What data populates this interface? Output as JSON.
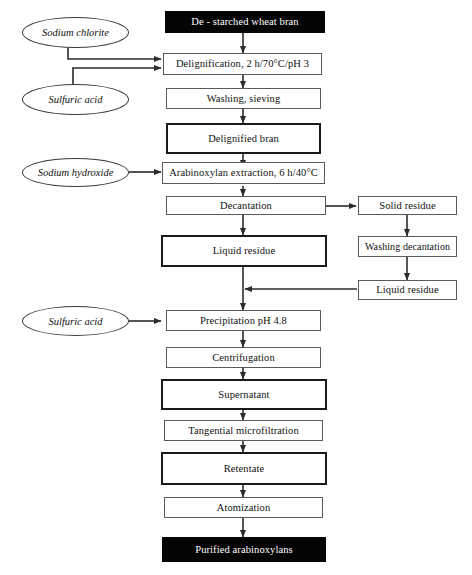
{
  "diagram": {
    "colors": {
      "terminal_fill": "#050505",
      "terminal_text": "#ffffff",
      "box_fill": "#ffffff",
      "box_border_thin": "#5a5a5a",
      "box_border_thick": "#1a1a1a",
      "arrow": "#2b2b2b",
      "background": "#ffffff"
    },
    "reagents": [
      {
        "id": "sodium-chlorite",
        "label": "Sodium chlorite",
        "shape": "ellipse"
      },
      {
        "id": "sulfuric-acid-1",
        "label": "Sulfuric acid",
        "shape": "ellipse"
      },
      {
        "id": "sodium-hydroxide",
        "label": "Sodium hydroxide",
        "shape": "ellipse"
      },
      {
        "id": "sulfuric-acid-2",
        "label": "Sulfuric acid",
        "shape": "ellipse"
      }
    ],
    "main_steps": [
      {
        "id": "de-starched-wheat-bran",
        "label": "De - starched wheat bran",
        "style": "terminal"
      },
      {
        "id": "delignification",
        "label": "Delignification, 2 h/70°C/pH 3",
        "style": "thin"
      },
      {
        "id": "washing-sieving",
        "label": "Washing, sieving",
        "style": "thin"
      },
      {
        "id": "delignified-bran",
        "label": "Delignified bran",
        "style": "thick"
      },
      {
        "id": "arabinoxylan-extraction",
        "label": "Arabinoxylan extraction, 6 h/40°C",
        "style": "thin"
      },
      {
        "id": "decantation",
        "label": "Decantation",
        "style": "thin"
      },
      {
        "id": "liquid-residue-main",
        "label": "Liquid residue",
        "style": "thick"
      },
      {
        "id": "precipitation",
        "label": "Precipitation pH 4.8",
        "style": "thin"
      },
      {
        "id": "centrifugation",
        "label": "Centrifugation",
        "style": "thin"
      },
      {
        "id": "supernatant",
        "label": "Supernatant",
        "style": "thick"
      },
      {
        "id": "tangential-microfiltration",
        "label": "Tangential microfiltration",
        "style": "thin"
      },
      {
        "id": "retentate",
        "label": "Retentate",
        "style": "thick"
      },
      {
        "id": "atomization",
        "label": "Atomization",
        "style": "thin"
      },
      {
        "id": "purified-arabinoxylans",
        "label": "Purified arabinoxylans",
        "style": "terminal"
      }
    ],
    "side_branch": [
      {
        "id": "solid-residue",
        "label": "Solid residue",
        "style": "thin"
      },
      {
        "id": "washing-decantation",
        "label": "Washing decantation",
        "style": "thin"
      },
      {
        "id": "liquid-residue-side",
        "label": "Liquid residue",
        "style": "thin"
      }
    ],
    "connections": [
      {
        "from": "de-starched-wheat-bran",
        "to": "delignification"
      },
      {
        "from": "sodium-chlorite",
        "to": "delignification"
      },
      {
        "from": "sulfuric-acid-1",
        "to": "delignification"
      },
      {
        "from": "delignification",
        "to": "washing-sieving"
      },
      {
        "from": "washing-sieving",
        "to": "delignified-bran"
      },
      {
        "from": "delignified-bran",
        "to": "arabinoxylan-extraction"
      },
      {
        "from": "sodium-hydroxide",
        "to": "arabinoxylan-extraction"
      },
      {
        "from": "arabinoxylan-extraction",
        "to": "decantation"
      },
      {
        "from": "decantation",
        "to": "liquid-residue-main"
      },
      {
        "from": "decantation",
        "to": "solid-residue"
      },
      {
        "from": "solid-residue",
        "to": "washing-decantation"
      },
      {
        "from": "washing-decantation",
        "to": "liquid-residue-side"
      },
      {
        "from": "liquid-residue-side",
        "to": "liquid-residue-main"
      },
      {
        "from": "liquid-residue-main",
        "to": "precipitation"
      },
      {
        "from": "sulfuric-acid-2",
        "to": "precipitation"
      },
      {
        "from": "precipitation",
        "to": "centrifugation"
      },
      {
        "from": "centrifugation",
        "to": "supernatant"
      },
      {
        "from": "supernatant",
        "to": "tangential-microfiltration"
      },
      {
        "from": "tangential-microfiltration",
        "to": "retentate"
      },
      {
        "from": "retentate",
        "to": "atomization"
      },
      {
        "from": "atomization",
        "to": "purified-arabinoxylans"
      }
    ]
  }
}
